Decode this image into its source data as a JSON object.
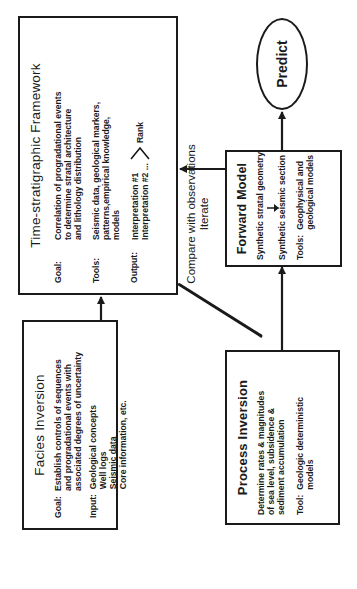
{
  "diagram": {
    "orientation": "rotated -90deg",
    "line_color": "#1a1a1a",
    "facies_inversion": {
      "title": "Facies Inversion",
      "goal_label": "Goal:",
      "goal_lines": [
        "Establish controls of sequences",
        "and progradational events with",
        "associated degrees of uncertainty"
      ],
      "input_label": "Input:",
      "input_lines": [
        "Geological concepts",
        "Well logs",
        "Seismic data",
        "Core information, etc."
      ]
    },
    "time_stratigraphic_framework": {
      "title": "Time-stratigraphic Framework",
      "goal_label": "Goal:",
      "goal_lines": [
        "Correlation of progradational events",
        "to determine stratal architecture",
        "and lithology distribution"
      ],
      "tools_label": "Tools:",
      "tools_lines": [
        "Seismic data, geological markers,",
        "patterns,empirical knowledge,",
        "models"
      ],
      "output_label": "Output:",
      "output_lines": [
        "Interpretation #1",
        "Interpretation #2 ..."
      ],
      "rank_label": "Rank"
    },
    "process_inversion": {
      "title": "Process Inversion",
      "desc_lines": [
        "Determine rates & magnitudes",
        "of sea level, subsidence &",
        "sediment accumulation"
      ],
      "tool_label": "Tool:",
      "tool_lines": [
        "Geologic deterministic",
        "models"
      ]
    },
    "forward_model": {
      "title": "Forward Model",
      "line1": "Synthetic stratal geometry",
      "line2": "Synthetic seismic section",
      "tools_label": "Tools:",
      "tools_lines": [
        "Geophysical and",
        "geological models"
      ]
    },
    "predict": {
      "label": "Predict"
    },
    "feedback_label": {
      "line1": "Compare with observations",
      "line2": "Iterate"
    }
  }
}
